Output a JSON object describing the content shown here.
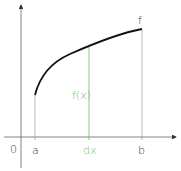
{
  "diagram": {
    "labels": {
      "origin": "0",
      "a": "a",
      "b": "b",
      "dx": "dx",
      "fx": "f(x)",
      "f": "f"
    },
    "colors": {
      "axis": "#555555",
      "curve": "#111111",
      "guide": "#aaaaaa",
      "highlight": "#6abf5e",
      "text": "#333333"
    }
  }
}
